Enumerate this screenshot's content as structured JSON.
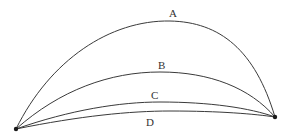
{
  "diagram": {
    "title": "",
    "endpoints": {
      "left": {
        "x": 16,
        "y": 129
      },
      "right": {
        "x": 275,
        "y": 117
      }
    },
    "curves": [
      {
        "id": "A",
        "label": "A",
        "label_pos": {
          "x": 173,
          "y": 17
        },
        "path": "M16,129 C50,60 110,20 170,21 C220,22 255,50 275,117"
      },
      {
        "id": "B",
        "label": "B",
        "label_pos": {
          "x": 162,
          "y": 69
        },
        "path": "M16,129 C60,90 110,72 160,72 C210,72 250,88 275,117"
      },
      {
        "id": "C",
        "label": "C",
        "label_pos": {
          "x": 155,
          "y": 99
        },
        "path": "M16,129 C70,110 120,102 160,102 C210,102 250,108 275,117"
      },
      {
        "id": "D",
        "label": "D",
        "label_pos": {
          "x": 150,
          "y": 126
        },
        "path": "M16,129 C80,116 130,111 170,111 C220,111 255,114 275,117"
      }
    ],
    "colors": {
      "stroke": "#3a3a3a",
      "endpoint": "#1a1a1a",
      "background": "#ffffff"
    }
  }
}
